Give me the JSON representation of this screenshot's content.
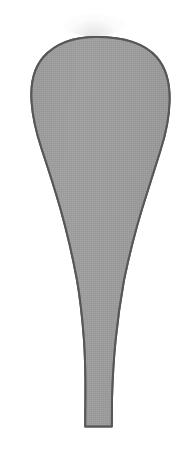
{
  "image": {
    "title": "Teardrop paddle silhouette",
    "subject_name": "tapered-bulb-shape",
    "description": "Gray filled teardrop / paddle-shaped silhouette with a wide rounded bulb at the top narrowing into a slender straight stem at the bottom, drawn on a plain white background.",
    "width": 185,
    "height": 463,
    "orientation": "portrait"
  },
  "colors": {
    "background": "#ffffff",
    "fill": "#9b9b9b",
    "fill_light": "#a6a6a6",
    "fill_dark": "#919191",
    "outline": "#575757",
    "halo": "#cdcdcd"
  },
  "geometry": {
    "outline_width_px": 2,
    "bulb": {
      "top_y": 37,
      "left_x": 31,
      "right_x": 169,
      "max_width": 138,
      "widest_y": 112
    },
    "stem": {
      "bottom_y": 427,
      "left_x": 85,
      "right_x": 112,
      "width": 27
    },
    "taper": {
      "start_y": 150,
      "end_y": 400
    },
    "path": "M 96.5 37 C 74 37 55 44 43.5 57 C 33 69 30.5 85 31.5 101 C 32.5 118 37 135 42 150 C 48 168 54.5 188 60.5 209 C 67 232 72.5 256 77 280 C 80.5 300 82.5 320 84 340 C 85.2 358 85.6 378 85.4 398 L 85.2 426.5 L 111.8 426.5 L 112 398 C 112.6 378 113.8 358 115.6 340 C 117.6 320 120.4 300 124 280 C 129 256 135 232 142 209 C 148.6 188 155 168 160.6 150 C 165.4 135 169.2 118 169.6 101 C 170 85 167 69 156.5 57 C 145 44 124 37 96.5 37 Z"
  },
  "labels": {
    "none_visible": ""
  }
}
